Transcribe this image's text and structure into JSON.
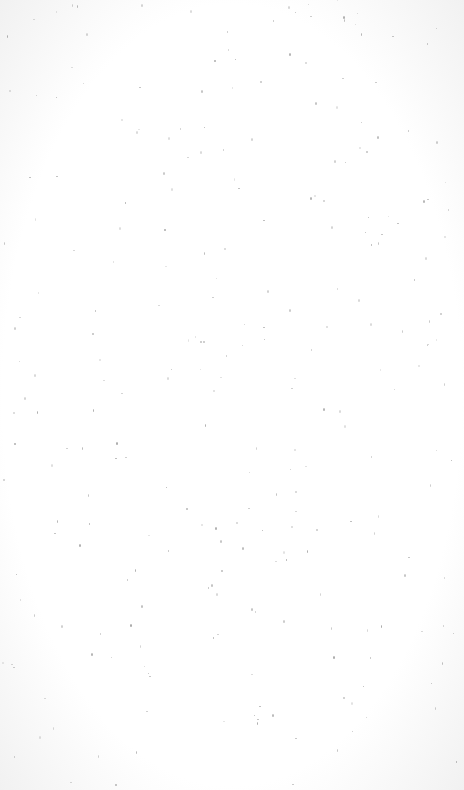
{
  "page": {
    "background_color": "#fdfdfd",
    "edge_shade_color": "#f1f1f1",
    "speck_color": "#8a8a8a",
    "speck_count": 260
  }
}
